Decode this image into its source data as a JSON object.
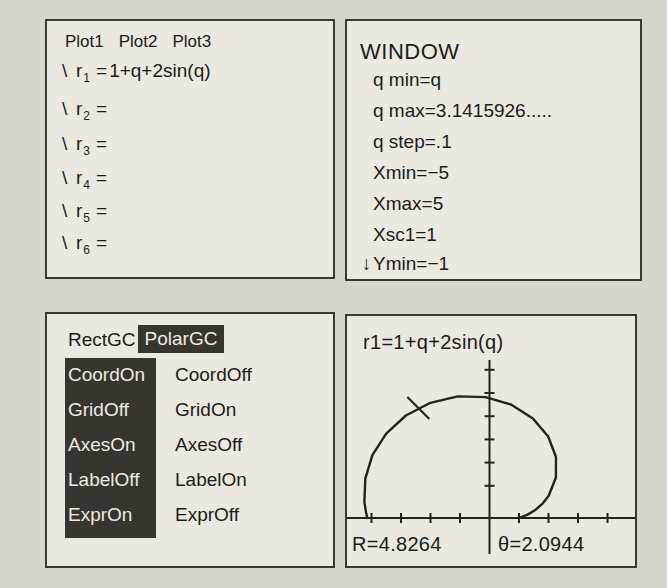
{
  "colors": {
    "page_bg": "#d8d5cd",
    "screen_bg": "#eae8e1",
    "ink": "#1d1c18",
    "highlight_bg": "#37352f",
    "highlight_text": "#edebe3"
  },
  "panels": {
    "y_editor": {
      "plot_labels": [
        "Plot1",
        "Plot2",
        "Plot3"
      ],
      "rows": [
        {
          "slash": "\\",
          "var": "r",
          "sub": "1",
          "eq": "=",
          "expr": "1+q+2sin(q)"
        },
        {
          "slash": "\\",
          "var": "r",
          "sub": "2",
          "eq": "=",
          "expr": ""
        },
        {
          "slash": "\\",
          "var": "r",
          "sub": "3",
          "eq": "=",
          "expr": ""
        },
        {
          "slash": "\\",
          "var": "r",
          "sub": "4",
          "eq": "=",
          "expr": ""
        },
        {
          "slash": "\\",
          "var": "r",
          "sub": "5",
          "eq": "=",
          "expr": ""
        },
        {
          "slash": "\\",
          "var": "r",
          "sub": "6",
          "eq": "=",
          "expr": ""
        }
      ]
    },
    "window": {
      "title": "WINDOW",
      "rows": [
        {
          "prefix": "",
          "text": "q min=q"
        },
        {
          "prefix": "",
          "text": "q max=3.1415926....."
        },
        {
          "prefix": "",
          "text": "q step=.1"
        },
        {
          "prefix": "",
          "text": "Xmin=−5"
        },
        {
          "prefix": "",
          "text": "Xmax=5"
        },
        {
          "prefix": "",
          "text": "Xsc1=1"
        },
        {
          "prefix": "↓",
          "text": "Ymin=−1"
        }
      ]
    },
    "format": {
      "header": {
        "left": "RectGC",
        "right": "PolarGC",
        "selected": "right"
      },
      "options": [
        {
          "left": "CoordOn",
          "right": "CoordOff"
        },
        {
          "left": "GridOff",
          "right": "GridOn"
        },
        {
          "left": "AxesOn",
          "right": "AxesOff"
        },
        {
          "left": "LabelOff",
          "right": "LabelOn"
        },
        {
          "left": "ExprOn",
          "right": "ExprOff"
        }
      ],
      "selected_column": "left"
    },
    "graph": {
      "equation": "r1=1+q+2sin(q)",
      "readout_r": "R=4.8264",
      "readout_theta": "θ=2.0944"
    }
  },
  "chart_data": {
    "type": "line",
    "subtype": "polar",
    "title": "r1=1+q+2sin(q)",
    "equation": "r(q)=1+q+2sin(q)",
    "theta_range": [
      0,
      3.1415926
    ],
    "theta_step": 0.1,
    "window": {
      "xmin": -5,
      "xmax": 5,
      "xscl": 1,
      "ymin": -1
    },
    "trace": {
      "R": 4.8264,
      "theta": 2.0944,
      "x": -2.413,
      "y": 4.18
    },
    "xticks": [
      -4,
      -3,
      -2,
      -1,
      1,
      2,
      3,
      4
    ],
    "yticks": [
      1,
      2,
      3,
      4,
      5,
      6
    ],
    "points": [
      [
        1.0,
        0.0
      ],
      [
        1.293,
        0.13
      ],
      [
        1.565,
        0.317
      ],
      [
        1.806,
        0.559
      ],
      [
        2.007,
        0.848
      ],
      [
        2.252,
        1.541
      ],
      [
        2.254,
        2.321
      ],
      [
        1.99,
        3.099
      ],
      [
        1.472,
        3.788
      ],
      [
        0.743,
        4.307
      ],
      [
        -0.134,
        4.598
      ],
      [
        -1.079,
        4.624
      ],
      [
        -2.005,
        4.382
      ],
      [
        -2.833,
        3.896
      ],
      [
        -3.501,
        3.209
      ],
      [
        -3.968,
        2.388
      ],
      [
        -4.209,
        1.498
      ],
      [
        -4.239,
        0.604
      ],
      [
        -4.179,
        0.174
      ],
      [
        -4.142,
        0.0
      ]
    ]
  }
}
